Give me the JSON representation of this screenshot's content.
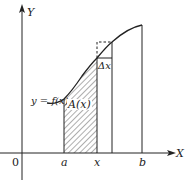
{
  "diagram": {
    "type": "area-under-curve illustration",
    "axes": {
      "x_label": "X",
      "y_label": "Y",
      "origin_label": "0"
    },
    "curve_label": "y = f(x)",
    "area_label": "A(x)",
    "increment_label": "Δx",
    "tick_labels": [
      "a",
      "x",
      "b"
    ],
    "colors": {
      "ink": "#222222",
      "background": "#ffffff"
    }
  }
}
